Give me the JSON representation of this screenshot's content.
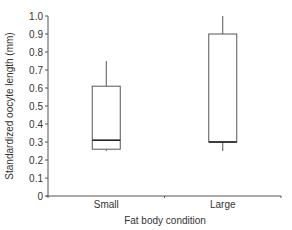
{
  "chart_data": {
    "type": "box",
    "title": "",
    "xlabel": "Fat body condition",
    "ylabel": "Standardized oocyte length (mm)",
    "ylim": [
      0,
      1.0
    ],
    "yticks": [
      "0",
      "0.1",
      "0.2",
      "0.3",
      "0.4",
      "0.5",
      "0.6",
      "0.7",
      "0.8",
      "0.9",
      "1.0"
    ],
    "categories": [
      "Small",
      "Large"
    ],
    "series": [
      {
        "name": "Small",
        "whisker_low": 0.25,
        "q1": 0.26,
        "median": 0.31,
        "q3": 0.61,
        "whisker_high": 0.75
      },
      {
        "name": "Large",
        "whisker_low": 0.25,
        "q1": 0.3,
        "median": 0.3,
        "q3": 0.9,
        "whisker_high": 1.0
      }
    ],
    "grid": false,
    "legend": null
  }
}
